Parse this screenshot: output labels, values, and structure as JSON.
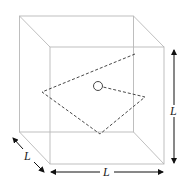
{
  "diagram": {
    "labels": {
      "depth": "L",
      "width": "L",
      "height": "L"
    },
    "colors": {
      "edges": "#b8b8b8",
      "dashed": "#333333",
      "arrows": "#111111"
    }
  }
}
